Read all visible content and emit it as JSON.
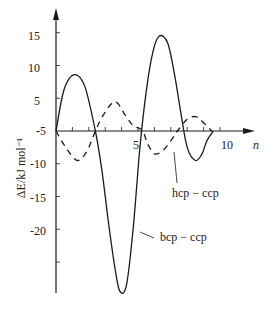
{
  "chart_data": {
    "type": "line",
    "title": "",
    "xlabel": "n",
    "ylabel": "ΔE/kJ mol⁻¹",
    "xlim": [
      0,
      11
    ],
    "ylim": [
      -28,
      17
    ],
    "grid": false,
    "x_ticks": [
      0,
      1,
      2,
      3,
      4,
      5,
      6,
      7,
      8,
      9,
      10
    ],
    "x_tick_labels": [
      {
        "value": 5,
        "label": "5"
      },
      {
        "value": 10,
        "label": "10"
      }
    ],
    "y_tick_labels": [
      {
        "value": 15,
        "label": "15"
      },
      {
        "value": 10,
        "label": "10"
      },
      {
        "value": 5,
        "label": "5"
      },
      {
        "value": 0,
        "label": "-5"
      },
      {
        "value": -5,
        "label": "-10"
      },
      {
        "value": -10,
        "label": "-15"
      },
      {
        "value": -15,
        "label": "-20"
      },
      {
        "value": -20,
        "label": ""
      }
    ],
    "series": [
      {
        "name": "bcp - ccp",
        "style": "solid",
        "x": [
          0,
          0.4,
          0.8,
          1.3,
          1.8,
          2.4,
          2.8,
          3.2,
          3.6,
          3.9,
          4.3,
          4.7,
          5.1,
          5.5,
          5.9,
          6.3,
          6.8,
          7.2,
          7.6,
          8.0,
          8.5,
          8.9,
          9.2,
          9.6
        ],
        "y": [
          0,
          5.5,
          8.0,
          8.5,
          6.5,
          0,
          -6,
          -14,
          -21,
          -24.5,
          -23.5,
          -15,
          -3,
          6,
          12,
          14.5,
          13.5,
          9,
          3,
          -2.5,
          -4.5,
          -3.5,
          -1.5,
          0
        ]
      },
      {
        "name": "hcp - ccp",
        "style": "dashed",
        "x": [
          0,
          0.6,
          1.3,
          1.9,
          2.4,
          2.9,
          3.6,
          4.2,
          4.7,
          5.0,
          5.3,
          5.6,
          6.0,
          6.5,
          7.0,
          7.4,
          8.0,
          8.5,
          8.9,
          9.5
        ],
        "y": [
          0,
          -2.5,
          -4.5,
          -3,
          0,
          2.5,
          4.5,
          2.5,
          0.8,
          0.5,
          0,
          -2,
          -3.5,
          -3,
          -1.5,
          0,
          1.8,
          2.2,
          1.5,
          0
        ]
      }
    ],
    "annotations": [
      {
        "text": "hcp − ccp",
        "target_series": "hcp - ccp"
      },
      {
        "text": "bcp − ccp",
        "target_series": "bcp - ccp"
      }
    ],
    "legend": "inline annotations with leader lines"
  },
  "labels": {
    "x_axis": "n",
    "y_axis": "ΔE/kJ mol⁻¹",
    "y_ticks": [
      "15",
      "10",
      "5",
      "-5",
      "-10",
      "-15",
      "-20"
    ],
    "x_ticks": [
      "5",
      "10"
    ],
    "hcp": "hcp − ccp",
    "bcp": "bcp − ccp"
  },
  "style": {
    "line_color": "#1a1a1a",
    "background": "#ffffff"
  }
}
